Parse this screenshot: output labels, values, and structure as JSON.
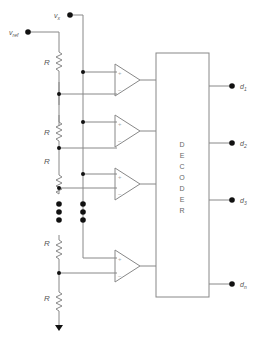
{
  "diagram": {
    "inputs": {
      "vref_label": "v",
      "vref_sub": "ref",
      "vx_label": "v",
      "vx_sub": "x"
    },
    "resistor_label": "R",
    "resistors": [
      "R",
      "R",
      "R",
      "R",
      "R"
    ],
    "comparator_plus": "+",
    "comparator_minus": "−",
    "decoder_letters": [
      "D",
      "E",
      "C",
      "O",
      "D",
      "E",
      "R"
    ],
    "outputs": [
      {
        "label": "d",
        "sub": "1"
      },
      {
        "label": "d",
        "sub": "2"
      },
      {
        "label": "d",
        "sub": "3"
      },
      {
        "label": "d",
        "sub": "n"
      }
    ],
    "colors": {
      "wire": "#888888",
      "node": "#111111",
      "text": "#555555"
    }
  }
}
